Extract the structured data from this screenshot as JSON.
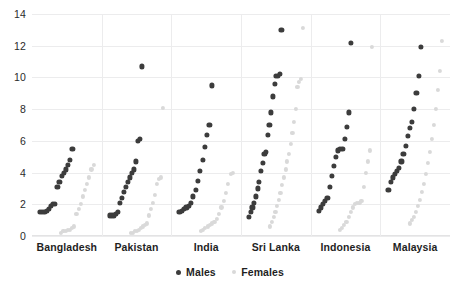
{
  "chart_data": {
    "type": "scatter",
    "title": "",
    "xlabel": "",
    "ylabel": "",
    "ylim": [
      0,
      14
    ],
    "yticks": [
      0,
      2,
      4,
      6,
      8,
      10,
      12,
      14
    ],
    "grid": true,
    "legend_position": "bottom",
    "categories": [
      "Bangladesh",
      "Pakistan",
      "India",
      "Sri Lanka",
      "Indonesia",
      "Malaysia"
    ],
    "legend": [
      {
        "name": "Males",
        "color": "#3c3c3c"
      },
      {
        "name": "Females",
        "color": "#d9d9d9"
      }
    ],
    "series": [
      {
        "name": "Males",
        "color": "#3c3c3c",
        "groups": [
          {
            "category": "Bangladesh",
            "values": [
              1.5,
              1.5,
              1.5,
              1.6,
              1.7,
              1.9,
              2.0,
              2.0,
              3.1,
              3.4,
              3.8,
              4.0,
              4.2,
              4.5,
              4.8,
              5.5
            ]
          },
          {
            "category": "Pakistan",
            "values": [
              1.3,
              1.3,
              1.3,
              1.4,
              1.5,
              2.1,
              2.4,
              2.8,
              3.1,
              3.4,
              3.7,
              4.0,
              4.2,
              4.7,
              6.0,
              6.1,
              10.7
            ]
          },
          {
            "category": "India",
            "values": [
              1.5,
              1.6,
              1.7,
              1.8,
              1.9,
              2.1,
              2.5,
              2.9,
              3.5,
              4.1,
              4.8,
              5.6,
              6.4,
              7.0,
              9.5
            ]
          },
          {
            "category": "Sri Lanka",
            "values": [
              1.2,
              1.5,
              1.8,
              2.1,
              2.5,
              3.0,
              3.4,
              4.1,
              4.6,
              5.2,
              5.3,
              6.4,
              7.0,
              7.8,
              8.8,
              9.6,
              10.1,
              10.1,
              10.2,
              13.0
            ]
          },
          {
            "category": "Indonesia",
            "values": [
              1.6,
              1.8,
              2.0,
              2.2,
              2.4,
              3.1,
              3.8,
              4.4,
              5.0,
              5.4,
              5.5,
              5.5,
              6.1,
              6.9,
              7.8,
              12.2
            ]
          },
          {
            "category": "Malaysia",
            "values": [
              2.9,
              3.4,
              3.7,
              3.9,
              4.1,
              4.3,
              4.7,
              5.2,
              5.7,
              6.3,
              6.8,
              7.2,
              8.0,
              9.0,
              10.1,
              11.9
            ]
          }
        ]
      },
      {
        "name": "Females",
        "color": "#d9d9d9",
        "groups": [
          {
            "category": "Bangladesh",
            "values": [
              0.2,
              0.3,
              0.3,
              0.4,
              0.4,
              0.5,
              0.6,
              1.4,
              1.7,
              2.0,
              2.5,
              2.9,
              3.3,
              3.7,
              4.2,
              4.5
            ]
          },
          {
            "category": "Pakistan",
            "values": [
              0.2,
              0.2,
              0.3,
              0.3,
              0.4,
              0.5,
              0.6,
              0.7,
              0.8,
              1.3,
              1.7,
              2.1,
              2.6,
              3.3,
              3.6,
              3.7,
              8.1
            ]
          },
          {
            "category": "India",
            "values": [
              0.3,
              0.4,
              0.5,
              0.6,
              0.7,
              0.8,
              0.9,
              1.1,
              1.4,
              1.8,
              2.2,
              2.7,
              3.3,
              3.9,
              4.0
            ]
          },
          {
            "category": "Sri Lanka",
            "values": [
              0.6,
              0.9,
              1.2,
              1.5,
              1.9,
              2.3,
              2.7,
              3.2,
              3.7,
              4.2,
              4.7,
              5.2,
              5.8,
              6.5,
              7.2,
              8.0,
              9.4,
              9.7,
              9.9,
              13.1
            ]
          },
          {
            "category": "Indonesia",
            "values": [
              0.4,
              0.5,
              0.7,
              0.9,
              1.2,
              1.5,
              1.8,
              2.0,
              2.1,
              2.1,
              2.2,
              3.1,
              4.0,
              4.7,
              5.4,
              11.9
            ]
          },
          {
            "category": "Malaysia",
            "values": [
              0.8,
              1.0,
              1.2,
              1.5,
              1.9,
              2.3,
              2.8,
              3.3,
              3.9,
              4.6,
              5.3,
              6.1,
              7.0,
              8.0,
              9.2,
              10.4,
              12.3
            ]
          }
        ]
      }
    ]
  }
}
